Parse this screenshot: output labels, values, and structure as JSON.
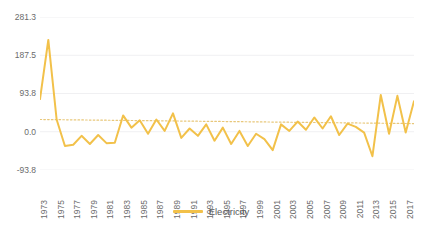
{
  "chart_data": {
    "type": "line",
    "title": "",
    "xlabel": "",
    "ylabel": "",
    "grid": true,
    "legend_position": "bottom",
    "ylim": [
      -93.8,
      281.3
    ],
    "yticks": [
      281.3,
      187.5,
      93.8,
      0.0,
      -93.8
    ],
    "ytick_labels": [
      "281.3",
      "187.5",
      "93.8",
      "0.0",
      "-93.8"
    ],
    "x": [
      1973,
      1974,
      1975,
      1976,
      1977,
      1978,
      1979,
      1980,
      1981,
      1982,
      1983,
      1984,
      1985,
      1986,
      1987,
      1988,
      1989,
      1990,
      1991,
      1992,
      1993,
      1994,
      1995,
      1996,
      1997,
      1998,
      1999,
      2000,
      2001,
      2002,
      2003,
      2004,
      2005,
      2006,
      2007,
      2008,
      2009,
      2010,
      2011,
      2012,
      2013,
      2014,
      2015,
      2016,
      2017,
      2018
    ],
    "xtick_labels": [
      "1973",
      "1975",
      "1977",
      "1979",
      "1981",
      "1983",
      "1985",
      "1987",
      "1989",
      "1991",
      "1993",
      "1995",
      "1997",
      "1999",
      "2001",
      "2003",
      "2005",
      "2007",
      "2009",
      "2011",
      "2013",
      "2015",
      "2017"
    ],
    "xticks": [
      1973,
      1975,
      1977,
      1979,
      1981,
      1983,
      1985,
      1987,
      1989,
      1991,
      1993,
      1995,
      1997,
      1999,
      2001,
      2003,
      2005,
      2007,
      2009,
      2011,
      2013,
      2015,
      2017
    ],
    "series": [
      {
        "name": "Electricity",
        "color": "#F2C14A",
        "values": [
          80,
          225,
          30,
          -35,
          -32,
          -10,
          -30,
          -8,
          -28,
          -27,
          40,
          10,
          28,
          -5,
          30,
          2,
          45,
          -15,
          8,
          -10,
          18,
          -22,
          10,
          -30,
          2,
          -35,
          -5,
          -18,
          -45,
          18,
          2,
          25,
          5,
          35,
          8,
          38,
          -8,
          20,
          12,
          -2,
          -60,
          90,
          -5,
          88,
          -2,
          75
        ]
      }
    ],
    "trendline": {
      "name": "trend",
      "color": "#E8C77A",
      "style": "dotted",
      "y_start": 30,
      "y_end": 20
    }
  },
  "legend": {
    "entries": [
      {
        "label": "Electricity",
        "color": "#F2C14A"
      }
    ]
  }
}
